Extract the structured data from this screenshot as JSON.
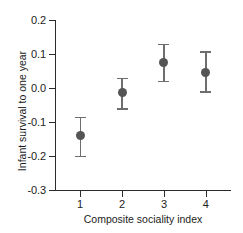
{
  "chart_data": {
    "type": "scatter",
    "title": "",
    "xlabel": "Composite sociality index",
    "ylabel": "Infant survival to one year",
    "grid": false,
    "legend": "none",
    "x": [
      1,
      2,
      3,
      4
    ],
    "categories": [
      "1",
      "2",
      "3",
      "4"
    ],
    "xtick_labels": [
      "1",
      "2",
      "3",
      "4"
    ],
    "ytick_labels": [
      "0.2",
      "0.1",
      "0.0",
      "-0.1",
      "-0.2",
      "-0.3"
    ],
    "ytick_values": [
      0.2,
      0.1,
      0.0,
      -0.1,
      -0.2,
      -0.3
    ],
    "xlim": [
      0.4,
      4.6
    ],
    "ylim": [
      -0.3,
      0.2
    ],
    "series": [
      {
        "name": "Infant survival to one year",
        "marker": "circle",
        "color": "#555555",
        "errorbar_color": "#6e6e6e",
        "values": [
          -0.14,
          -0.012,
          0.075,
          0.045
        ],
        "err_low": [
          -0.2,
          -0.06,
          0.02,
          -0.01
        ],
        "err_high": [
          -0.085,
          0.03,
          0.13,
          0.108
        ]
      }
    ],
    "points": [
      {
        "x": 1,
        "y": -0.14,
        "low": -0.2,
        "high": -0.085
      },
      {
        "x": 2,
        "y": -0.012,
        "low": -0.06,
        "high": 0.03
      },
      {
        "x": 3,
        "y": 0.075,
        "low": 0.02,
        "high": 0.13
      },
      {
        "x": 4,
        "y": 0.045,
        "low": -0.01,
        "high": 0.108
      }
    ]
  },
  "axes": {
    "x_title": "Composite sociality index",
    "y_title": "Infant survival to one year"
  },
  "colors": {
    "marker": "#555555",
    "errorbar": "#6e6e6e",
    "axis": "#2b2b2b",
    "text": "#1c1c1c",
    "background": "#ffffff"
  }
}
